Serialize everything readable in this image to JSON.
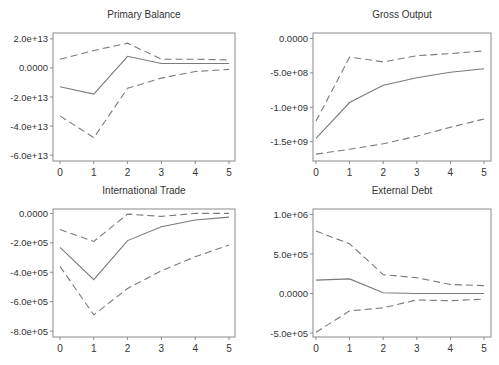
{
  "chart_data": [
    {
      "type": "line",
      "title": "Primary Balance",
      "x": [
        0,
        1,
        2,
        3,
        4,
        5
      ],
      "ylim": [
        -64000000000000.0,
        24000000000000.0
      ],
      "yticks": [
        20000000000000.0,
        0,
        -20000000000000.0,
        -40000000000000.0,
        -60000000000000.0
      ],
      "ytick_labels": [
        "2.0e+13",
        "0.0000",
        "-2.0e+13",
        "-4.0e+13",
        "-6.0e+13"
      ],
      "xtick_labels": [
        "0",
        "1",
        "2",
        "3",
        "4",
        "5"
      ],
      "series": [
        {
          "name": "response",
          "style": "solid",
          "values": [
            -13000000000000.0,
            -18000000000000.0,
            8000000000000.0,
            3000000000000.0,
            3000000000000.0,
            3000000000000.0
          ]
        },
        {
          "name": "upper",
          "style": "dashed",
          "values": [
            6000000000000.0,
            12000000000000.0,
            17000000000000.0,
            6000000000000.0,
            6000000000000.0,
            5500000000000.0
          ]
        },
        {
          "name": "lower",
          "style": "dashed",
          "values": [
            -33000000000000.0,
            -48000000000000.0,
            -14000000000000.0,
            -7000000000000.0,
            -2500000000000.0,
            -1000000000000.0
          ]
        }
      ],
      "grid": false
    },
    {
      "type": "line",
      "title": "Gross Output",
      "x": [
        0,
        1,
        2,
        3,
        4,
        5
      ],
      "ylim": [
        -1780000000.0,
        80000000.0
      ],
      "yticks": [
        0,
        -500000000.0,
        -1000000000.0,
        -1500000000.0
      ],
      "ytick_labels": [
        "0.0000",
        "-5.0e+08",
        "-1.0e+09",
        "-1.5e+09"
      ],
      "xtick_labels": [
        "0",
        "1",
        "2",
        "3",
        "4",
        "5"
      ],
      "series": [
        {
          "name": "response",
          "style": "solid",
          "values": [
            -1450000000.0,
            -930000000.0,
            -680000000.0,
            -570000000.0,
            -490000000.0,
            -440000000.0
          ]
        },
        {
          "name": "upper",
          "style": "dashed",
          "values": [
            -1200000000.0,
            -270000000.0,
            -340000000.0,
            -250000000.0,
            -220000000.0,
            -180000000.0
          ]
        },
        {
          "name": "lower",
          "style": "dashed",
          "values": [
            -1680000000.0,
            -1610000000.0,
            -1530000000.0,
            -1420000000.0,
            -1290000000.0,
            -1170000000.0
          ]
        }
      ],
      "grid": false
    },
    {
      "type": "line",
      "title": "International Trade",
      "x": [
        0,
        1,
        2,
        3,
        4,
        5
      ],
      "ylim": [
        -840000.0,
        30000.0
      ],
      "yticks": [
        0,
        -200000.0,
        -400000.0,
        -600000.0,
        -800000.0
      ],
      "ytick_labels": [
        "0.0000",
        "-2.0e+05",
        "-4.0e+05",
        "-6.0e+05",
        "-8.0e+05"
      ],
      "xtick_labels": [
        "0",
        "1",
        "2",
        "3",
        "4",
        "5"
      ],
      "series": [
        {
          "name": "response",
          "style": "solid",
          "values": [
            -230000.0,
            -450000.0,
            -185000.0,
            -90000.0,
            -45000.0,
            -25000.0
          ]
        },
        {
          "name": "upper",
          "style": "dashed",
          "values": [
            -110000.0,
            -190000.0,
            -5000.0,
            -20000.0,
            0.0,
            0.0
          ]
        },
        {
          "name": "lower",
          "style": "dashed",
          "values": [
            -360000.0,
            -690000.0,
            -510000.0,
            -390000.0,
            -295000.0,
            -215000.0
          ]
        }
      ],
      "grid": false
    },
    {
      "type": "line",
      "title": "External Debt",
      "x": [
        0,
        1,
        2,
        3,
        4,
        5
      ],
      "ylim": [
        -550000.0,
        1070000.0
      ],
      "yticks": [
        1000000.0,
        500000.0,
        0,
        -500000.0
      ],
      "ytick_labels": [
        "1.0e+06",
        "5.0e+05",
        "0.0000",
        "-5.0e+05"
      ],
      "xtick_labels": [
        "0",
        "1",
        "2",
        "3",
        "4",
        "5"
      ],
      "series": [
        {
          "name": "response",
          "style": "solid",
          "values": [
            170000.0,
            185000.0,
            10000.0,
            0.0,
            0.0,
            0.0
          ]
        },
        {
          "name": "upper",
          "style": "dashed",
          "values": [
            790000.0,
            630000.0,
            240000.0,
            200000.0,
            115000.0,
            100000.0
          ]
        },
        {
          "name": "lower",
          "style": "dashed",
          "values": [
            -490000.0,
            -220000.0,
            -180000.0,
            -80000.0,
            -90000.0,
            -70000.0
          ]
        }
      ],
      "grid": false
    }
  ],
  "colors": {
    "line": "#7a7a7a",
    "frame": "#8a8a8a",
    "text": "#333333",
    "background": "#ffffff"
  }
}
